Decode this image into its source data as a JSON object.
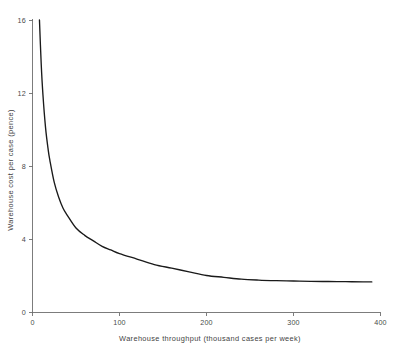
{
  "chart_data": {
    "type": "line",
    "title": "",
    "xlabel": "Warehouse throughput (thousand cases per week)",
    "ylabel": "Warehouse cost per case (pence)",
    "xlim": [
      0,
      400
    ],
    "ylim": [
      0,
      16
    ],
    "xticks": [
      "0",
      "100",
      "200",
      "300",
      "400"
    ],
    "xtick_values": [
      0,
      100,
      200,
      300,
      400
    ],
    "yticks": [
      "0",
      "4",
      "8",
      "12",
      "16"
    ],
    "ytick_values": [
      0,
      4,
      8,
      12,
      16
    ],
    "grid": false,
    "legend": "none",
    "series": [
      {
        "name": "Warehouse cost per case",
        "x": [
          8,
          10,
          12,
          15,
          18,
          20,
          25,
          30,
          35,
          40,
          50,
          60,
          70,
          80,
          90,
          100,
          120,
          140,
          160,
          180,
          200,
          220,
          240,
          260,
          280,
          300,
          320,
          340,
          360,
          380,
          390
        ],
        "values": [
          16.0,
          13.6,
          11.9,
          10.1,
          8.9,
          8.3,
          7.1,
          6.3,
          5.7,
          5.3,
          4.6,
          4.2,
          3.9,
          3.6,
          3.4,
          3.2,
          2.9,
          2.6,
          2.4,
          2.2,
          2.0,
          1.9,
          1.8,
          1.75,
          1.72,
          1.7,
          1.68,
          1.67,
          1.66,
          1.65,
          1.65
        ]
      }
    ],
    "annotations": [],
    "curve_note": "Hyperbolic decline: high unit cost at low throughput falling to an asymptote near 1.65 pence per case above about 250 thousand cases per week.",
    "colors": {
      "curve": "#1a1a1a",
      "axis": "#6e6e6e",
      "text": "#4a4a4a",
      "background": "#ffffff"
    }
  }
}
